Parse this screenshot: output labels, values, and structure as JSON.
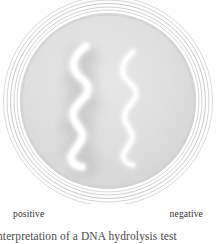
{
  "figure": {
    "kind": "petri-dish-photograph",
    "caption": "nterpretation of a DNA hydrolysis test",
    "labels": {
      "left": "positive",
      "right": "negative"
    },
    "colors": {
      "background": "#ffffff",
      "agar": "#e3e3e3",
      "agar_edge": "#d2d2d2",
      "rim_ring": "#c9c9c9",
      "clearing_halo": "#c6c6c6",
      "colony_streak": "#ffffff",
      "label_text": "#2f2f2f",
      "caption_text": "#4a4a4a"
    },
    "plate": {
      "center_x": 108,
      "center_y": 101,
      "outer_radius": 105,
      "agar_radius": 88,
      "rim_ring_count": 5
    },
    "streaks": [
      {
        "name": "positive-streak",
        "result": "positive",
        "side": "left",
        "has_clearing_halo": true,
        "halo_radius": 26,
        "stroke_width": 6.5,
        "path": "M 86 46 C 78 52 72 60 74 68 C 76 77 86 79 88 87 C 90 96 78 101 74 110 C 70 120 80 125 82 133 C 84 141 76 147 72 154 C 69 160 74 166 82 167"
      },
      {
        "name": "negative-streak",
        "result": "negative",
        "side": "right",
        "has_clearing_halo": false,
        "halo_radius": 0,
        "stroke_width": 4.2,
        "path": "M 133 52 C 126 58 121 66 123 74 C 125 82 134 84 136 91 C 138 100 128 104 125 113 C 122 122 130 127 132 134 C 134 141 127 147 124 153 C 121 159 126 164 133 165"
      }
    ]
  }
}
